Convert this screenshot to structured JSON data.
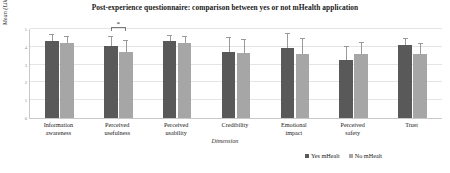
{
  "chart_data": {
    "type": "bar",
    "title": "Post-experience questionnaire: comparison between yes or not mHealth application",
    "xlabel": "Dimension",
    "ylabel": "Mean (Likert scale 5-points)",
    "ylim": [
      0,
      5
    ],
    "yticks": [
      0,
      1,
      2,
      3,
      4,
      5
    ],
    "ytick_labels": [
      "0",
      "1",
      "2",
      "3",
      "4",
      "5"
    ],
    "grid": true,
    "legend_position": "bottom-right",
    "categories": [
      "Information awareness",
      "Perceived usefulness",
      "Perceived usability",
      "Credibility",
      "Emotional impact",
      "Perceived safety",
      "Trust"
    ],
    "category_lines": [
      [
        "Information",
        "awareness"
      ],
      [
        "Perceived",
        "usefulness"
      ],
      [
        "Perceived",
        "usability"
      ],
      [
        "Credibility",
        ""
      ],
      [
        "Emotional",
        "impact"
      ],
      [
        "Perceived",
        "safety"
      ],
      [
        "Trust",
        ""
      ]
    ],
    "series": [
      {
        "name": "Yes mHealt",
        "color": "#595959",
        "values": [
          4.35,
          4.02,
          4.32,
          3.7,
          3.92,
          3.28,
          4.08
        ],
        "errors": [
          0.3,
          0.52,
          0.3,
          0.78,
          0.78,
          0.72,
          0.35
        ]
      },
      {
        "name": "No mHealt",
        "color": "#a6a6a6",
        "values": [
          4.22,
          3.72,
          4.22,
          3.65,
          3.62,
          3.58,
          3.58
        ],
        "errors": [
          0.32,
          0.6,
          0.32,
          0.72,
          0.8,
          0.62,
          0.6
        ]
      }
    ],
    "annotations": [
      {
        "type": "significance-bracket",
        "label": "*",
        "category": "Perceived usefulness",
        "between": [
          "Yes mHealt",
          "No mHealt"
        ]
      }
    ]
  },
  "legend": {
    "entries": [
      {
        "label": "Yes mHealt",
        "color": "#595959"
      },
      {
        "label": "No mHealt",
        "color": "#a6a6a6"
      }
    ]
  }
}
